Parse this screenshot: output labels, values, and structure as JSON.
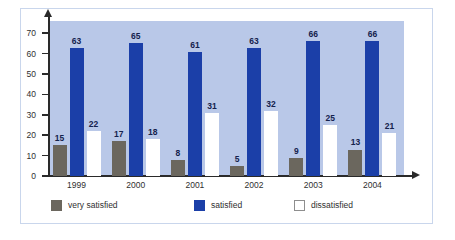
{
  "chart_data": {
    "type": "bar",
    "title": "",
    "xlabel": "",
    "ylabel": "",
    "ylim": [
      0,
      70
    ],
    "yticks": [
      0,
      10,
      20,
      30,
      40,
      50,
      60,
      70
    ],
    "grid": false,
    "legend_position": "bottom",
    "categories": [
      "1999",
      "2000",
      "2001",
      "2002",
      "2003",
      "2004"
    ],
    "series": [
      {
        "name": "very satisfied",
        "color": "#6b675e",
        "values": [
          15,
          17,
          8,
          5,
          9,
          13
        ]
      },
      {
        "name": "satisfied",
        "color": "#1b3fa8",
        "values": [
          63,
          65,
          61,
          63,
          66,
          66
        ]
      },
      {
        "name": "dissatisfied",
        "color": "#ffffff",
        "values": [
          22,
          18,
          31,
          32,
          25,
          21
        ]
      }
    ]
  },
  "figure": {
    "plot_background": "#b9c8e8",
    "frame_border": "#c9d6ec",
    "axis_color": "#2a2a2a",
    "label_color": "#14224d"
  }
}
